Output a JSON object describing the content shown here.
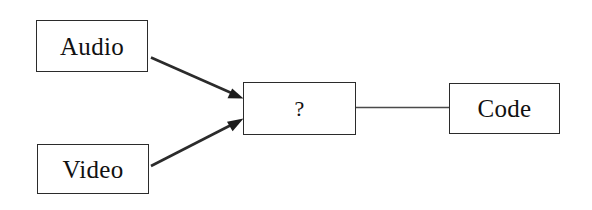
{
  "diagram": {
    "background_color": "#ffffff",
    "stroke_color": "#2b2b2b",
    "text_color": "#111111",
    "nodes": [
      {
        "id": "audio",
        "label": "Audio",
        "x": 36,
        "y": 20,
        "width": 112,
        "height": 52
      },
      {
        "id": "video",
        "label": "Video",
        "x": 37,
        "y": 144,
        "width": 112,
        "height": 50
      },
      {
        "id": "question",
        "label": "?",
        "x": 243,
        "y": 82,
        "width": 113,
        "height": 53
      },
      {
        "id": "code",
        "label": "Code",
        "x": 449,
        "y": 83,
        "width": 111,
        "height": 51
      }
    ],
    "edges": [
      {
        "id": "audio-to-question",
        "from": "audio",
        "to": "question",
        "arrowhead": true,
        "label": ""
      },
      {
        "id": "video-to-question",
        "from": "video",
        "to": "question",
        "arrowhead": true,
        "label": ""
      },
      {
        "id": "question-to-code",
        "from": "question",
        "to": "code",
        "arrowhead": false,
        "label": ""
      }
    ]
  }
}
